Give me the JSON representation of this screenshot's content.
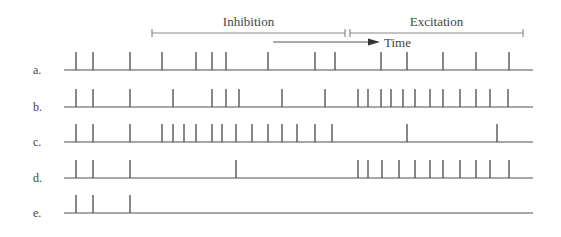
{
  "header": {
    "inhibition_label": "Inhibition",
    "excitation_label": "Excitation",
    "time_label": "Time",
    "inhibition_span": [
      152,
      345
    ],
    "excitation_span": [
      350,
      523
    ],
    "time_arrow": [
      273,
      380
    ]
  },
  "colors": {
    "line": "#8a8a8a",
    "spike": "#555555",
    "text": "#444444"
  },
  "axis": {
    "x_start": 64,
    "x_end": 533,
    "spike_height": 18
  },
  "rows": [
    {
      "label": "a.",
      "baseline": 70,
      "spikes": [
        76,
        93,
        130,
        162,
        196,
        212,
        226,
        268,
        315,
        335,
        381,
        407,
        443,
        476,
        509
      ]
    },
    {
      "label": "b.",
      "baseline": 107,
      "spikes": [
        76,
        93,
        130,
        173,
        212,
        226,
        239,
        282,
        325,
        358,
        368,
        381,
        391,
        403,
        415,
        430,
        443,
        460,
        476,
        490,
        508
      ]
    },
    {
      "label": "c.",
      "baseline": 142,
      "spikes": [
        76,
        93,
        130,
        162,
        173,
        184,
        196,
        212,
        222,
        236,
        252,
        268,
        282,
        297,
        315,
        332,
        407,
        497
      ]
    },
    {
      "label": "d.",
      "baseline": 178,
      "spikes": [
        76,
        93,
        130,
        236,
        358,
        368,
        382,
        399,
        415,
        430,
        443,
        460,
        476,
        490,
        509
      ]
    },
    {
      "label": "e.",
      "baseline": 213,
      "spikes": [
        76,
        93,
        130
      ]
    }
  ]
}
